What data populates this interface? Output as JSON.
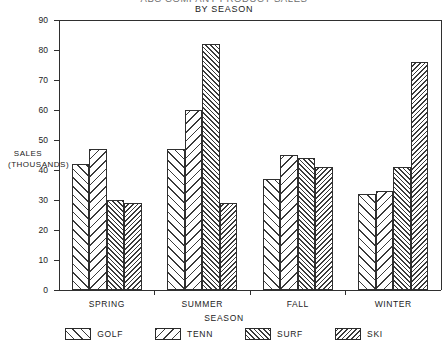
{
  "titles": {
    "main": "ABC COMPANY PRODUCT SALES",
    "sub": "BY SEASON"
  },
  "axes": {
    "y_label_line1": "SALES",
    "y_label_line2": "(THOUSANDS)",
    "x_label": "SEASON"
  },
  "legend": {
    "entries": [
      {
        "label": "GOLF",
        "pattern": "pat-golf"
      },
      {
        "label": "TENN",
        "pattern": "pat-tenn"
      },
      {
        "label": "SURF",
        "pattern": "pat-surf"
      },
      {
        "label": "SKI",
        "pattern": "pat-ski"
      }
    ]
  },
  "chart_data": {
    "type": "bar",
    "title": "ABC COMPANY PRODUCT SALES",
    "subtitle": "BY SEASON",
    "xlabel": "SEASON",
    "ylabel": "SALES (THOUSANDS)",
    "categories": [
      "SPRING",
      "SUMMER",
      "FALL",
      "WINTER"
    ],
    "yticks": [
      0,
      10,
      20,
      30,
      40,
      50,
      60,
      70,
      80,
      90
    ],
    "ylim": [
      0,
      90
    ],
    "grid": false,
    "legend_position": "bottom",
    "series": [
      {
        "name": "GOLF",
        "pattern": "pat-golf",
        "values": [
          42,
          47,
          37,
          32
        ]
      },
      {
        "name": "TENN",
        "pattern": "pat-tenn",
        "values": [
          47,
          60,
          45,
          33
        ]
      },
      {
        "name": "SURF",
        "pattern": "pat-surf",
        "values": [
          30,
          82,
          44,
          41
        ]
      },
      {
        "name": "SKI",
        "pattern": "pat-ski",
        "values": [
          29,
          29,
          41,
          76
        ]
      }
    ]
  },
  "plot_geometry": {
    "left": 59,
    "right": 441,
    "top": 20,
    "bottom": 290
  }
}
